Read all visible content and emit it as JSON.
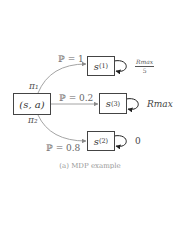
{
  "diagram": {
    "source_node": {
      "label": "(s, a)"
    },
    "branches": [
      {
        "policy": "π₁",
        "target": "s",
        "target_sup": "(1)",
        "prob_label": "ℙ = 1",
        "reward": "R_max / 5",
        "reward_num": "Rmax",
        "reward_den": "5"
      },
      {
        "policy": "",
        "target": "s",
        "target_sup": "(3)",
        "prob_label": "ℙ = 0.2",
        "reward": "Rmax"
      },
      {
        "policy": "π₂",
        "target": "s",
        "target_sup": "(2)",
        "prob_label": "ℙ = 0.8",
        "reward": "0"
      }
    ],
    "policy_labels": {
      "pi1": "π₁",
      "pi2": "π₂"
    },
    "caption": "(a) MDP example"
  },
  "colors": {
    "arrow": "#8a8a8a",
    "box_border": "#444444",
    "self_loop": "#222222"
  }
}
